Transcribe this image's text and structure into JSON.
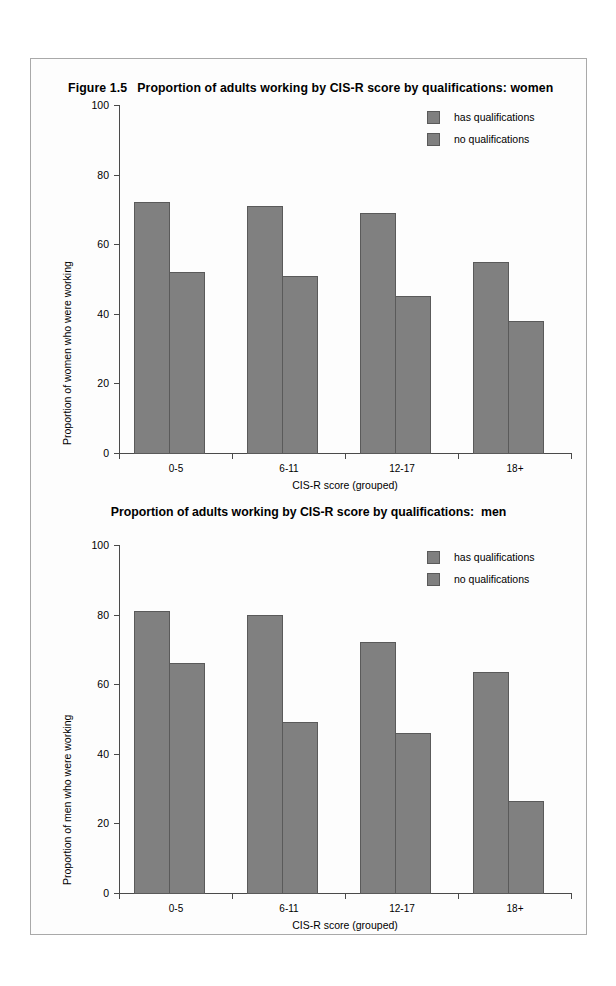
{
  "figure": {
    "number": "Figure 1.5",
    "title_women": "Proportion of adults working by CIS-R score by qualifications: women",
    "title_men": "Proportion of adults working by CIS-R score by qualifications:  men"
  },
  "legend": {
    "items": [
      {
        "label": "has qualifications",
        "color": "#808080"
      },
      {
        "label": "no qualifications",
        "color": "#808080"
      }
    ]
  },
  "chart_data": [
    {
      "type": "bar",
      "title": "Figure 1.5  Proportion of adults working by CIS-R score by qualifications: women",
      "xlabel": "CIS-R score (grouped)",
      "ylabel": "Proportion of women who were working",
      "categories": [
        "0-5",
        "6-11",
        "12-17",
        "18+"
      ],
      "ylim": [
        0,
        100
      ],
      "yticks": [
        0,
        20,
        40,
        60,
        80,
        100
      ],
      "ytick_labels": [
        "0",
        "20",
        "40",
        "60",
        "80",
        "100"
      ],
      "grid": false,
      "legend_position": "top-right",
      "series": [
        {
          "name": "has qualifications",
          "values": [
            72,
            71,
            69,
            55
          ],
          "color": "#808080"
        },
        {
          "name": "no qualifications",
          "values": [
            52,
            51,
            45,
            38
          ],
          "color": "#808080"
        }
      ]
    },
    {
      "type": "bar",
      "title": "Proportion of adults working by CIS-R score by qualifications:  men",
      "xlabel": "CIS-R score (grouped)",
      "ylabel": "Proportion of men who were working",
      "categories": [
        "0-5",
        "6-11",
        "12-17",
        "18+"
      ],
      "ylim": [
        0,
        100
      ],
      "yticks": [
        0,
        20,
        40,
        60,
        80,
        100
      ],
      "ytick_labels": [
        "0",
        "20",
        "40",
        "60",
        "80",
        "100"
      ],
      "grid": false,
      "legend_position": "top-right",
      "series": [
        {
          "name": "has qualifications",
          "values": [
            81,
            80,
            72,
            63.5
          ],
          "color": "#808080"
        },
        {
          "name": "no qualifications",
          "values": [
            66,
            49,
            46,
            26.5
          ],
          "color": "#808080"
        }
      ]
    }
  ]
}
